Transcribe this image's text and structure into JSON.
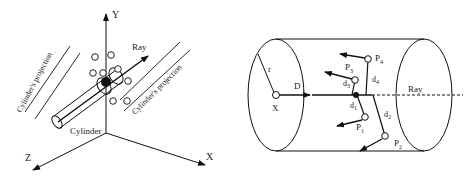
{
  "left_figure": {
    "axes": {
      "y": "Y",
      "x": "X",
      "z": "Z"
    },
    "ray_label": "Ray",
    "cylinder_label": "Cylinder",
    "projection_left": "Cylinder's projection",
    "projection_right": "Cylinder's projection"
  },
  "right_figure": {
    "radius_label": "r",
    "direction_label": "D",
    "origin_label": "X",
    "ray_label": "Ray",
    "points": [
      {
        "label": "P",
        "sub": "1"
      },
      {
        "label": "P",
        "sub": "2"
      },
      {
        "label": "P",
        "sub": "3"
      },
      {
        "label": "P",
        "sub": "4"
      }
    ],
    "distances": [
      {
        "label": "d",
        "sub": "1"
      },
      {
        "label": "d",
        "sub": "2"
      },
      {
        "label": "d",
        "sub": "3"
      },
      {
        "label": "d",
        "sub": "4"
      }
    ]
  }
}
